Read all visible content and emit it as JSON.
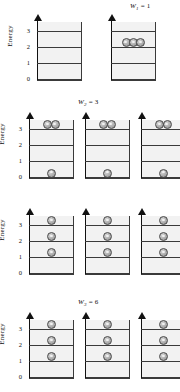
{
  "figure": {
    "axis_label": "Energy",
    "tick_labels": [
      "0",
      "1",
      "2",
      "3"
    ],
    "level_values": [
      0,
      1,
      2,
      3
    ],
    "particle_count": 3,
    "colors": {
      "line": "#3a3a3a",
      "panel_fill": "#f2f2f2",
      "ball_fill": "#b8b8b8",
      "ball_stroke": "#4a4a4a",
      "text": "#111111"
    },
    "rows": [
      {
        "id": "row-1",
        "label_text": "W",
        "label_sub": "1",
        "label_eq": " = 1",
        "label_visible": true,
        "panel_count": 2,
        "panels": [
          {
            "id": "panel-1-1",
            "occupancy": [],
            "show_axis": true
          },
          {
            "id": "panel-1-2",
            "occupancy": [
              {
                "level": 2,
                "count": 3
              }
            ],
            "show_axis": false
          }
        ]
      },
      {
        "id": "row-2",
        "label_text": "W",
        "label_sub": "2",
        "label_eq": " = 3",
        "label_visible": true,
        "panel_count": 3,
        "panels": [
          {
            "id": "panel-2-1",
            "occupancy": [
              {
                "level": 3,
                "count": 2
              },
              {
                "level": 0,
                "count": 1
              }
            ],
            "show_axis": true
          },
          {
            "id": "panel-2-2",
            "occupancy": [
              {
                "level": 3,
                "count": 2
              },
              {
                "level": 0,
                "count": 1
              }
            ],
            "show_axis": false
          },
          {
            "id": "panel-2-3",
            "occupancy": [
              {
                "level": 3,
                "count": 2
              },
              {
                "level": 0,
                "count": 1
              }
            ],
            "show_axis": false
          }
        ]
      },
      {
        "id": "row-3",
        "label_text": "",
        "label_sub": "",
        "label_eq": "",
        "label_visible": false,
        "panel_count": 3,
        "panels": [
          {
            "id": "panel-3-1",
            "occupancy": [
              {
                "level": 3,
                "count": 1
              },
              {
                "level": 2,
                "count": 1
              },
              {
                "level": 1,
                "count": 1
              }
            ],
            "show_axis": true
          },
          {
            "id": "panel-3-2",
            "occupancy": [
              {
                "level": 3,
                "count": 1
              },
              {
                "level": 2,
                "count": 1
              },
              {
                "level": 1,
                "count": 1
              }
            ],
            "show_axis": false
          },
          {
            "id": "panel-3-3",
            "occupancy": [
              {
                "level": 3,
                "count": 1
              },
              {
                "level": 2,
                "count": 1
              },
              {
                "level": 1,
                "count": 1
              }
            ],
            "show_axis": false
          }
        ]
      },
      {
        "id": "row-4",
        "label_text": "W",
        "label_sub": "3",
        "label_eq": " = 6",
        "label_visible": true,
        "panel_count": 3,
        "panels": [
          {
            "id": "panel-4-1",
            "occupancy": [
              {
                "level": 3,
                "count": 1
              },
              {
                "level": 2,
                "count": 1
              },
              {
                "level": 1,
                "count": 1
              }
            ],
            "show_axis": true
          },
          {
            "id": "panel-4-2",
            "occupancy": [
              {
                "level": 3,
                "count": 1
              },
              {
                "level": 2,
                "count": 1
              },
              {
                "level": 1,
                "count": 1
              }
            ],
            "show_axis": false
          },
          {
            "id": "panel-4-3",
            "occupancy": [
              {
                "level": 3,
                "count": 1
              },
              {
                "level": 2,
                "count": 1
              },
              {
                "level": 1,
                "count": 1
              }
            ],
            "show_axis": false
          }
        ]
      }
    ]
  }
}
